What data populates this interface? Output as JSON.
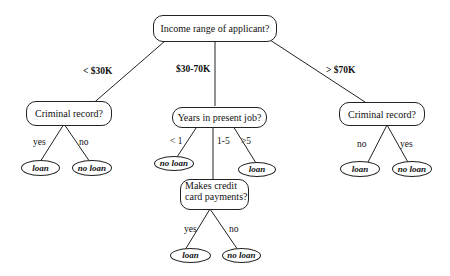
{
  "root": {
    "label": "Income range of applicant?"
  },
  "branches": {
    "left": "< $30K",
    "middle": "$30-70K",
    "right": "> $70K"
  },
  "left": {
    "label": "Criminal record?",
    "edges": [
      "yes",
      "no"
    ],
    "leaves": [
      "loan",
      "no loan"
    ]
  },
  "middle": {
    "label": "Years in present job?",
    "edges": [
      "< 1",
      "1-5",
      ">5"
    ],
    "leaves": [
      "no loan",
      "loan"
    ],
    "sub": {
      "line1": "Makes credit",
      "line2": "card payments?",
      "edges": [
        "yes",
        "no"
      ],
      "leaves": [
        "loan",
        "no loan"
      ]
    }
  },
  "right": {
    "label": "Criminal record?",
    "edges": [
      "no",
      "yes"
    ],
    "leaves": [
      "loan",
      "no loan"
    ]
  }
}
